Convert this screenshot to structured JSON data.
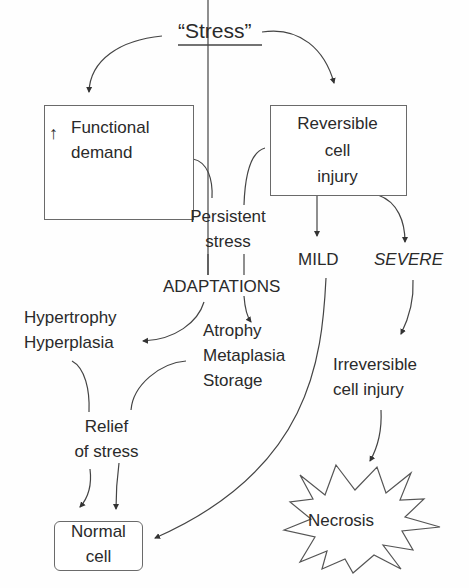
{
  "diagram": {
    "title": "“Stress”",
    "nodes": {
      "functional_demand": {
        "arrow_glyph": "↑",
        "line1": "Functional",
        "line2": "demand"
      },
      "reversible_injury": {
        "line1": "Reversible",
        "line2": "cell",
        "line3": "injury"
      },
      "persistent_stress": {
        "line1": "Persistent",
        "line2": "stress"
      },
      "adaptations": {
        "label": "ADAPTATIONS"
      },
      "hyper": {
        "line1": "Hypertrophy",
        "line2": "Hyperplasia"
      },
      "atrophy_group": {
        "line1": "Atrophy",
        "line2": "Metaplasia",
        "line3": "Storage"
      },
      "mild": {
        "label": "MILD"
      },
      "severe": {
        "label": "SEVERE"
      },
      "irreversible": {
        "line1": "Irreversible",
        "line2": "cell injury"
      },
      "relief": {
        "line1": "Relief",
        "line2": "of stress"
      },
      "normal_cell": {
        "line1": "Normal",
        "line2": "cell"
      },
      "necrosis": {
        "label": "Necrosis"
      }
    },
    "colors": {
      "line": "#3a3a3a",
      "text": "#2a2a2a",
      "box_border": "#6a6a6a"
    }
  }
}
